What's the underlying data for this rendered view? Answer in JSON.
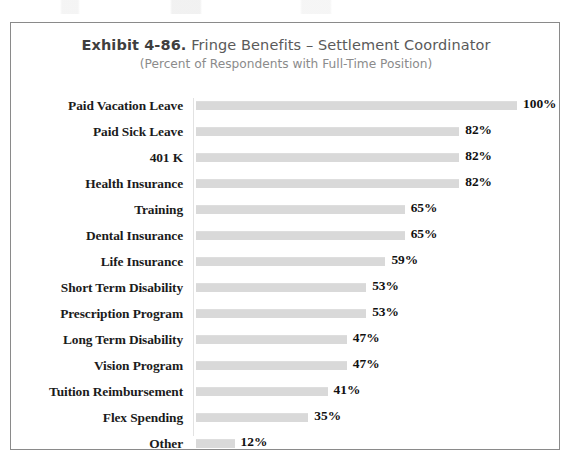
{
  "chart_data": {
    "type": "bar",
    "orientation": "horizontal",
    "title": "Exhibit 4-86.  Fringe Benefits – Settlement Coordinator",
    "title_prefix": "Exhibit 4-86.",
    "title_rest": " Fringe Benefits – Settlement Coordinator",
    "subtitle": "(Percent of Respondents with Full-Time Position)",
    "xlabel": "",
    "ylabel": "",
    "xlim": [
      0,
      100
    ],
    "grid": false,
    "legend": false,
    "bar_color": "#d9d9d9",
    "axis_color": "#e2e2e2",
    "frame_color": "#8a8a8a",
    "value_suffix": "%",
    "categories": [
      "Paid Vacation Leave",
      "Paid Sick Leave",
      "401 K",
      "Health Insurance",
      "Training",
      "Dental Insurance",
      "Life Insurance",
      "Short Term Disability",
      "Prescription Program",
      "Long Term Disability",
      "Vision Program",
      "Tuition Reimbursement",
      "Flex Spending",
      "Other"
    ],
    "values": [
      100,
      82,
      82,
      82,
      65,
      65,
      59,
      53,
      53,
      47,
      47,
      41,
      35,
      12
    ],
    "value_labels": [
      "100%",
      "82%",
      "82%",
      "82%",
      "65%",
      "65%",
      "59%",
      "53%",
      "53%",
      "47%",
      "47%",
      "41%",
      "35%",
      "12%"
    ],
    "rows": [
      {
        "label": "Paid Vacation Leave",
        "value": 100,
        "value_label": "100%"
      },
      {
        "label": "Paid Sick Leave",
        "value": 82,
        "value_label": "82%"
      },
      {
        "label": "401 K",
        "value": 82,
        "value_label": "82%"
      },
      {
        "label": "Health Insurance",
        "value": 82,
        "value_label": "82%"
      },
      {
        "label": "Training",
        "value": 65,
        "value_label": "65%"
      },
      {
        "label": "Dental Insurance",
        "value": 65,
        "value_label": "65%"
      },
      {
        "label": "Life Insurance",
        "value": 59,
        "value_label": "59%"
      },
      {
        "label": "Short Term Disability",
        "value": 53,
        "value_label": "53%"
      },
      {
        "label": "Prescription Program",
        "value": 53,
        "value_label": "53%"
      },
      {
        "label": "Long Term Disability",
        "value": 47,
        "value_label": "47%"
      },
      {
        "label": "Vision Program",
        "value": 47,
        "value_label": "47%"
      },
      {
        "label": "Tuition Reimbursement",
        "value": 41,
        "value_label": "41%"
      },
      {
        "label": "Flex Spending",
        "value": 35,
        "value_label": "35%"
      },
      {
        "label": "Other",
        "value": 12,
        "value_label": "12%"
      }
    ]
  }
}
